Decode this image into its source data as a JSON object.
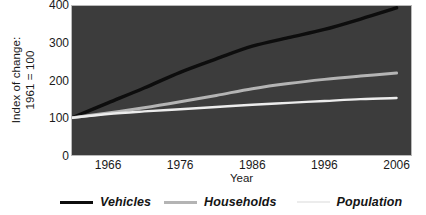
{
  "chart_data": {
    "type": "line",
    "title": "",
    "xlabel": "Year",
    "ylabel": "Index of change: 1961 = 100",
    "ylabel_line1": "Index of change:",
    "ylabel_line2": "1961 = 100",
    "xlim": [
      1961,
      2008
    ],
    "ylim": [
      0,
      400
    ],
    "grid": false,
    "legend_position": "bottom",
    "xticks": [
      "1966",
      "1976",
      "1986",
      "1996",
      "2006"
    ],
    "xtick_values": [
      1966,
      1976,
      1986,
      1996,
      2006
    ],
    "yticks": [
      "0",
      "100",
      "200",
      "300",
      "400"
    ],
    "ytick_values": [
      0,
      100,
      200,
      300,
      400
    ],
    "plot_background": "#3c3c3c",
    "x": [
      1961,
      1966,
      1971,
      1976,
      1981,
      1986,
      1991,
      1996,
      2001,
      2006
    ],
    "series": [
      {
        "name": "Vehicles",
        "color": "#0d0d0d",
        "values": [
          100,
          140,
          180,
          222,
          258,
          292,
          315,
          337,
          365,
          395
        ]
      },
      {
        "name": "Households",
        "color": "#b4b4b4",
        "values": [
          100,
          113,
          127,
          143,
          160,
          178,
          192,
          203,
          212,
          220
        ]
      },
      {
        "name": "Population",
        "color": "#ececec",
        "values": [
          100,
          110,
          117,
          123,
          129,
          135,
          140,
          145,
          150,
          153
        ]
      }
    ]
  },
  "legend": {
    "items": [
      {
        "label": "Vehicles",
        "color": "#0d0d0d",
        "icon": "line-swatch-icon",
        "thickness": 3.5
      },
      {
        "label": "Households",
        "color": "#b4b4b4",
        "icon": "line-swatch-icon",
        "thickness": 3.5
      },
      {
        "label": "Population",
        "color": "#ececec",
        "icon": "line-swatch-icon",
        "thickness": 2.5
      }
    ]
  }
}
